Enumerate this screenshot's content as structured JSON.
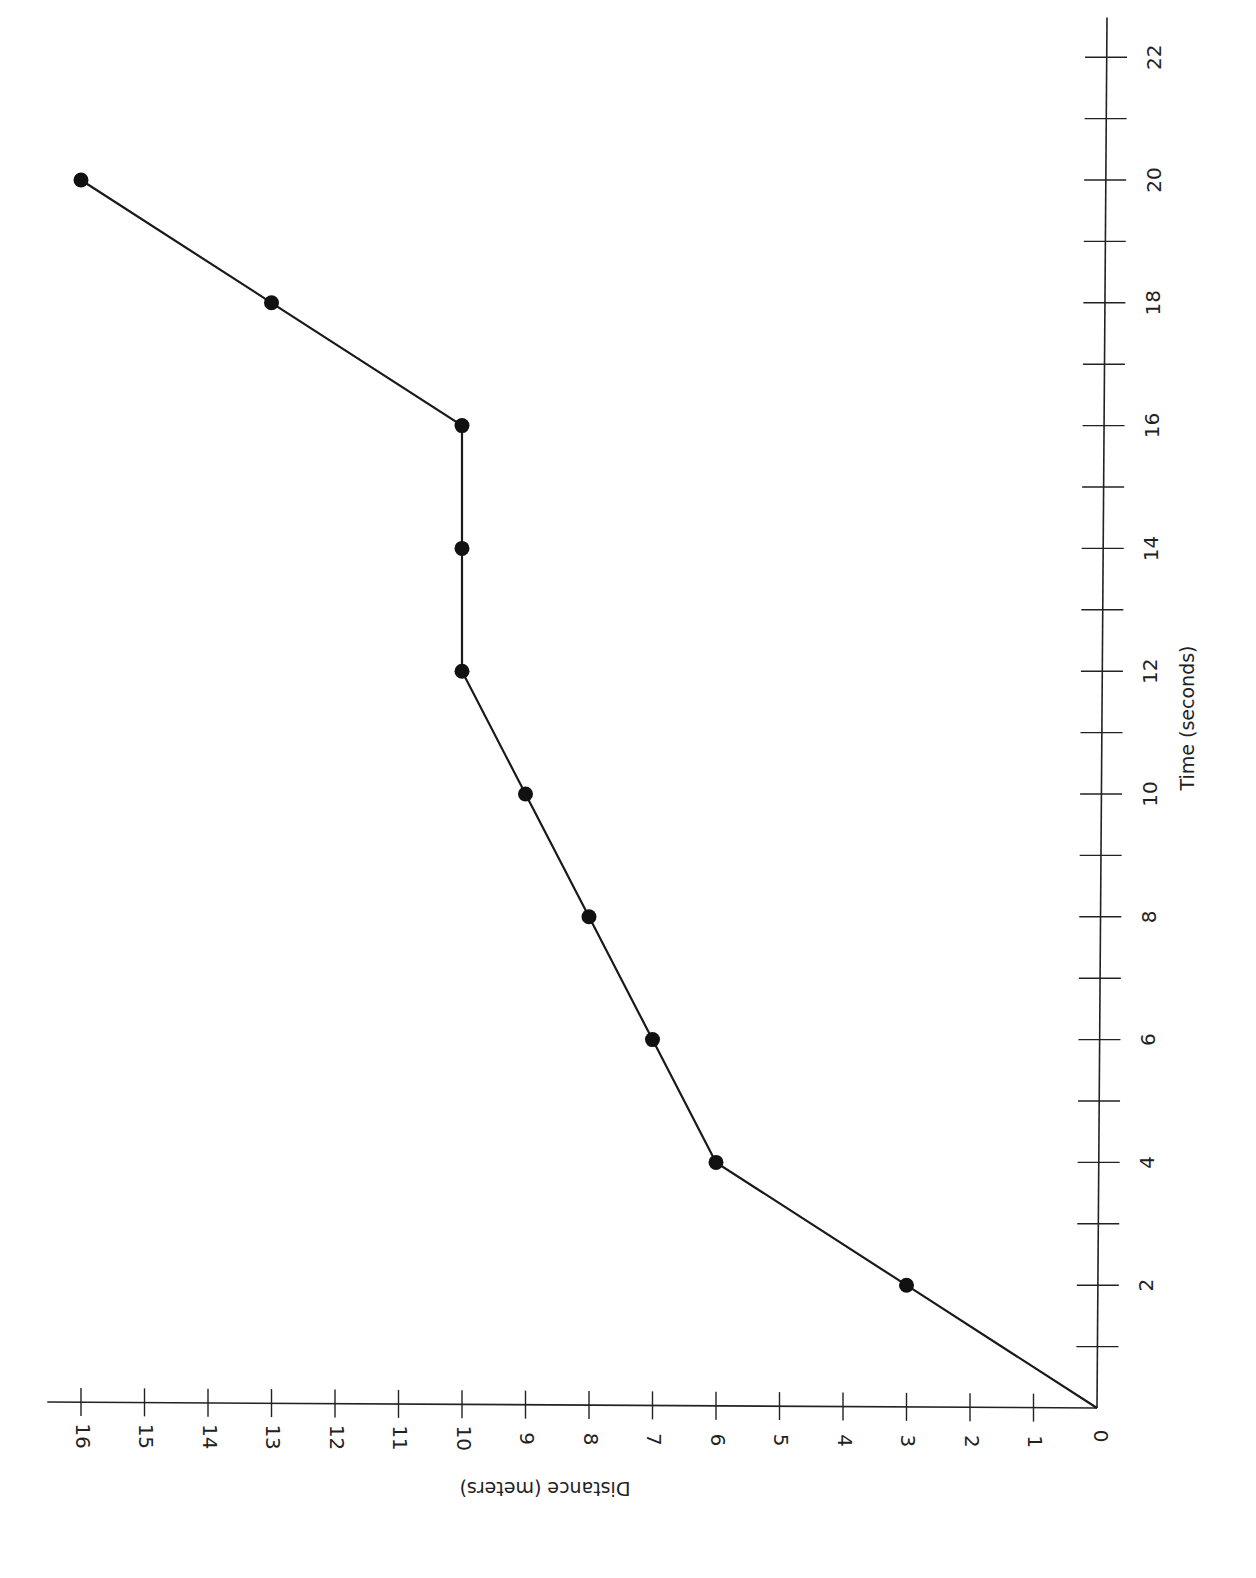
{
  "chart_data": {
    "type": "line",
    "title": "",
    "xlabel": "Time (seconds)",
    "ylabel": "Distance (meters)",
    "orientation": "rotated 90° clockwise (time axis vertical on right, distance axis horizontal at bottom)",
    "x": [
      0,
      2,
      4,
      6,
      8,
      10,
      12,
      14,
      16,
      18,
      20
    ],
    "series": [
      {
        "name": "Distance",
        "values": [
          0,
          3,
          6,
          7,
          8,
          9,
          10,
          10,
          10,
          13,
          16
        ],
        "color": "#1a1a1a",
        "markers": true
      }
    ],
    "xlim": [
      0,
      22
    ],
    "ylim": [
      0,
      16
    ],
    "x_ticks": [
      0,
      2,
      4,
      6,
      8,
      10,
      12,
      14,
      16,
      18,
      20,
      22
    ],
    "x_minor_ticks": [
      1,
      3,
      5,
      7,
      9,
      11,
      13,
      15,
      17,
      19,
      21
    ],
    "y_ticks": [
      1,
      2,
      3,
      4,
      5,
      6,
      7,
      8,
      9,
      10,
      11,
      12,
      13,
      14,
      15,
      16
    ],
    "origin_label": "0",
    "grid": false,
    "legend": null
  }
}
